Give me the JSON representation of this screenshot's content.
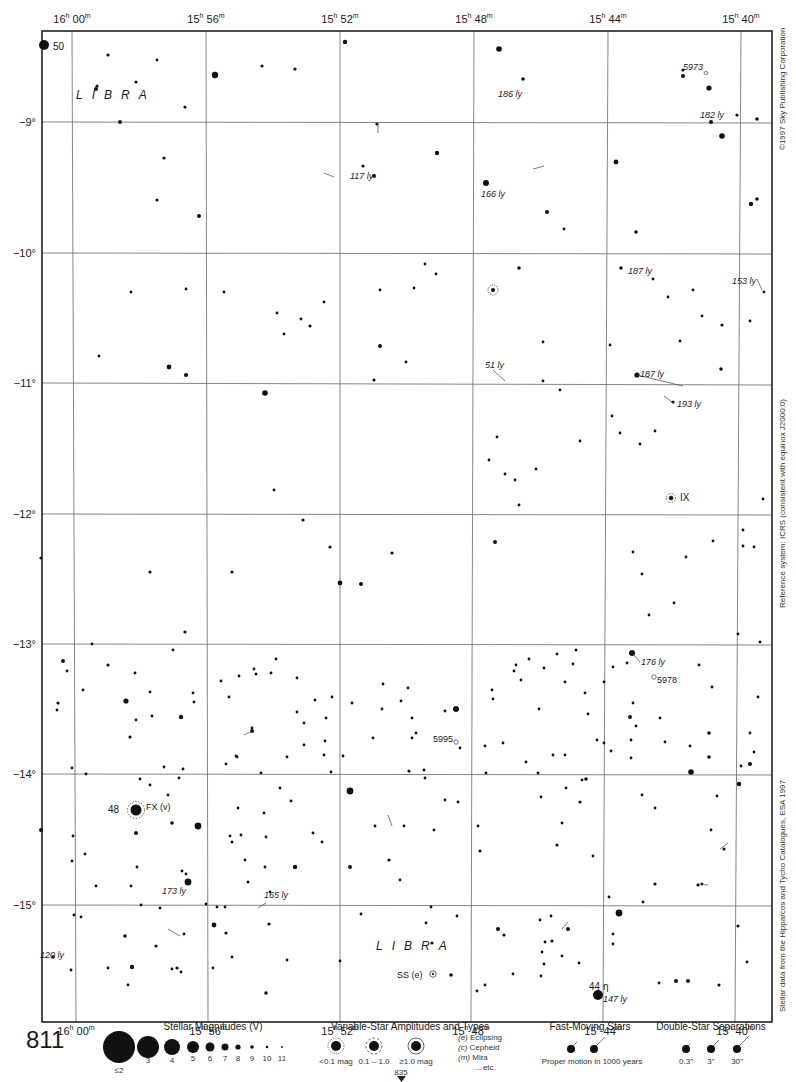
{
  "page": {
    "number": "811",
    "continuation_page": "835"
  },
  "map": {
    "constellation_labels": [
      {
        "text": "LIBRA",
        "x": 76,
        "y": 95
      },
      {
        "text": "LIBRA",
        "x": 376,
        "y": 946
      }
    ],
    "ra_axis_top": [
      {
        "h": "16",
        "m": "00",
        "x": 72
      },
      {
        "h": "15",
        "m": "56",
        "x": 206
      },
      {
        "h": "15",
        "m": "52",
        "x": 340
      },
      {
        "h": "15",
        "m": "48",
        "x": 474
      },
      {
        "h": "15",
        "m": "44",
        "x": 608
      },
      {
        "h": "15",
        "m": "40",
        "x": 741
      }
    ],
    "ra_axis_bottom": [
      {
        "h": "16",
        "m": "00",
        "x": 76
      },
      {
        "h": "15",
        "m": "56",
        "x": 208
      },
      {
        "h": "15",
        "m": "52",
        "x": 340
      },
      {
        "h": "15",
        "m": "48",
        "x": 471
      },
      {
        "h": "15",
        "m": "44",
        "x": 603
      },
      {
        "h": "15",
        "m": "40",
        "x": 735
      }
    ],
    "dec_axis": [
      {
        "label": "−9°",
        "y": 122
      },
      {
        "label": "−10°",
        "y": 253
      },
      {
        "label": "−11°",
        "y": 383
      },
      {
        "label": "−12°",
        "y": 514
      },
      {
        "label": "−13°",
        "y": 644
      },
      {
        "label": "−14°",
        "y": 774
      },
      {
        "label": "−15°",
        "y": 905
      }
    ],
    "distance_labels": [
      {
        "text": "186 ly",
        "x": 498,
        "y": 96
      },
      {
        "text": "182 ly",
        "x": 700,
        "y": 118
      },
      {
        "text": "117 ly",
        "x": 350,
        "y": 178
      },
      {
        "text": "166 ly",
        "x": 481,
        "y": 196
      },
      {
        "text": "187 ly",
        "x": 628,
        "y": 273
      },
      {
        "text": "153 ly",
        "x": 732,
        "y": 283
      },
      {
        "text": "51 ly",
        "x": 485,
        "y": 367
      },
      {
        "text": "187 ly",
        "x": 640,
        "y": 376
      },
      {
        "text": "193 ly",
        "x": 677,
        "y": 406
      },
      {
        "text": "176 ly",
        "x": 641,
        "y": 664
      },
      {
        "text": "173 ly",
        "x": 162,
        "y": 893
      },
      {
        "text": "165 ly",
        "x": 264,
        "y": 897
      },
      {
        "text": "120 ly",
        "x": 40,
        "y": 957
      },
      {
        "text": "147 ly",
        "x": 603,
        "y": 1001
      }
    ],
    "object_labels": [
      {
        "text": "50",
        "x": 53,
        "y": 50,
        "italic": false
      },
      {
        "text": "5973",
        "x": 711,
        "y": 70,
        "italic": true
      },
      {
        "text": "IX",
        "x": 708,
        "y": 498,
        "italic": false
      },
      {
        "text": "5978",
        "x": 657,
        "y": 681,
        "italic": false
      },
      {
        "text": "5995",
        "x": 433,
        "y": 742,
        "italic": false
      },
      {
        "text": "48",
        "x": 108,
        "y": 812,
        "italic": false
      },
      {
        "text": "FX (v)",
        "x": 146,
        "y": 810,
        "italic": false
      },
      {
        "text": "SS (e)",
        "x": 397,
        "y": 976,
        "italic": false
      },
      {
        "text": "44 η",
        "x": 589,
        "y": 987,
        "italic": false
      }
    ],
    "side_notes": {
      "copyright": "©1997 Sky Publishing Corporation",
      "reference": "Reference system: ICRS (consistent with equinox J2000.0)",
      "source": "Stellar data from the Hipparcos and Tycho Catalogues, ESA 1997"
    }
  },
  "legend": {
    "magnitudes": {
      "title": "Stellar Magnitudes (V)",
      "items": [
        {
          "label": "≤2",
          "r": 16
        },
        {
          "label": "3",
          "r": 11
        },
        {
          "label": "4",
          "r": 8
        },
        {
          "label": "5",
          "r": 6
        },
        {
          "label": "6",
          "r": 4.5
        },
        {
          "label": "7",
          "r": 3.5
        },
        {
          "label": "8",
          "r": 2.6
        },
        {
          "label": "9",
          "r": 1.8
        },
        {
          "label": "10",
          "r": 1.3
        },
        {
          "label": "11",
          "r": 0.9
        }
      ]
    },
    "variables": {
      "title": "Variable-Star Amplitudes and Types",
      "items": [
        "<0.1 mag",
        "0.1 – 1.0",
        "≥1.0 mag"
      ],
      "types": [
        {
          "code": "(e)",
          "name": "Eclipsing"
        },
        {
          "code": "(c)",
          "name": "Cepheid"
        },
        {
          "code": "(m)",
          "name": "Mira"
        },
        {
          "code": "",
          "name": "... etc."
        }
      ]
    },
    "fast_moving": {
      "title": "Fast-Moving Stars",
      "caption": "Proper motion in 1000 years"
    },
    "double_stars": {
      "title": "Double-Star Separations",
      "items": [
        "0.3\"",
        "3\"",
        "30\""
      ]
    }
  }
}
